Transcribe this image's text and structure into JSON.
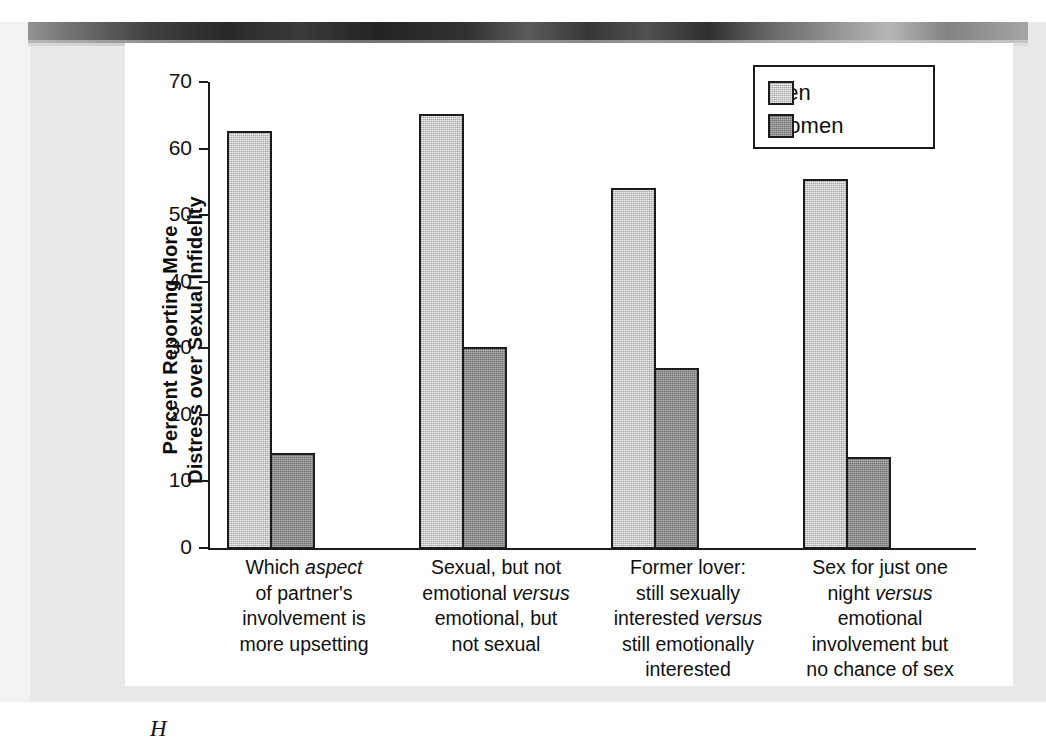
{
  "figure": {
    "caption_fragment": "H",
    "background_note": "scanned-page"
  },
  "chart_data": {
    "type": "bar",
    "title": "",
    "xlabel": "",
    "ylabel": "Percent Reporting More Distress over Sexual Infidelity",
    "ylabel_lines": [
      "Percent Reporting More",
      "Distress over Sexual Infidelity"
    ],
    "ylim": [
      0,
      70
    ],
    "yticks": [
      0,
      10,
      20,
      30,
      40,
      50,
      60,
      70
    ],
    "grid": false,
    "legend_position": "top-right",
    "categories": [
      "Which aspect of partner's involvement is more upsetting",
      "Sexual, but not emotional versus emotional, but not sexual",
      "Former lover: still sexually interested versus still emotionally interested",
      "Sex for just one night versus emotional involvement but no chance of sex"
    ],
    "category_label_lines": [
      [
        {
          "text": "Which ",
          "italic": false
        },
        {
          "text": "aspect",
          "italic": true
        },
        {
          "text": "\n",
          "italic": false
        },
        {
          "text": "of partner's\ninvolvement is\nmore upsetting",
          "italic": false
        }
      ]
    ],
    "series": [
      {
        "name": "Men",
        "color": "#c9c9c9",
        "values": [
          62.6,
          65.2,
          54.1,
          55.5
        ]
      },
      {
        "name": "Women",
        "color": "#8d8d8d",
        "values": [
          14.3,
          30.2,
          27.1,
          13.6
        ]
      }
    ]
  },
  "legend": {
    "items": [
      {
        "label": "Men",
        "color": "#c9c9c9"
      },
      {
        "label": "Women",
        "color": "#8d8d8d"
      }
    ]
  },
  "axis": {
    "tick_labels": [
      "70",
      "60",
      "50",
      "40",
      "30",
      "20",
      "10",
      "0"
    ]
  },
  "category_labels": [
    {
      "lines": [
        [
          {
            "t": "Which ",
            "i": false
          },
          {
            "t": "aspect",
            "i": true
          }
        ],
        [
          {
            "t": "of partner's",
            "i": false
          }
        ],
        [
          {
            "t": "involvement is",
            "i": false
          }
        ],
        [
          {
            "t": "more upsetting",
            "i": false
          }
        ]
      ]
    },
    {
      "lines": [
        [
          {
            "t": "Sexual, but not",
            "i": false
          }
        ],
        [
          {
            "t": "emotional ",
            "i": false
          },
          {
            "t": "versus",
            "i": true
          }
        ],
        [
          {
            "t": "emotional, but",
            "i": false
          }
        ],
        [
          {
            "t": "not sexual",
            "i": false
          }
        ]
      ]
    },
    {
      "lines": [
        [
          {
            "t": "Former lover:",
            "i": false
          }
        ],
        [
          {
            "t": "still sexually",
            "i": false
          }
        ],
        [
          {
            "t": "interested ",
            "i": false
          },
          {
            "t": "versus",
            "i": true
          }
        ],
        [
          {
            "t": "still emotionally",
            "i": false
          }
        ],
        [
          {
            "t": "interested",
            "i": false
          }
        ]
      ]
    },
    {
      "lines": [
        [
          {
            "t": "Sex for just one",
            "i": false
          }
        ],
        [
          {
            "t": "night ",
            "i": false
          },
          {
            "t": "versus",
            "i": true
          }
        ],
        [
          {
            "t": "emotional",
            "i": false
          }
        ],
        [
          {
            "t": "involvement but",
            "i": false
          }
        ],
        [
          {
            "t": "no chance of sex",
            "i": false
          }
        ]
      ]
    }
  ]
}
